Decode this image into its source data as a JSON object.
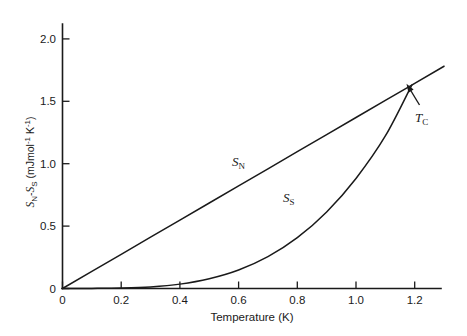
{
  "chart_data": {
    "type": "line",
    "title": "",
    "xlabel": "Temperature (K)",
    "ylabel": "S_N-S_S (mJ mol^-1 K^-1)",
    "xlim": [
      0,
      1.32
    ],
    "ylim": [
      0,
      2.22
    ],
    "grid": false,
    "legend": "inline-curve-labels",
    "xticks": [
      0,
      0.2,
      0.4,
      0.6,
      0.8,
      1.0,
      1.2
    ],
    "xtick_labels": [
      "0",
      "0.2",
      "0.4",
      "0.6",
      "0.8",
      "1.0",
      "1.2"
    ],
    "yticks": [
      0,
      0.5,
      1.0,
      1.5,
      2.0
    ],
    "ytick_labels": [
      "0",
      "0.5",
      "1.0",
      "1.5",
      "2.0"
    ],
    "series": [
      {
        "name": "S_N",
        "label": "S",
        "label_sub": "N",
        "description": "normal-state entropy, linear in temperature",
        "x": [
          0,
          0.1,
          0.2,
          0.3,
          0.4,
          0.5,
          0.6,
          0.7,
          0.8,
          0.9,
          1.0,
          1.1,
          1.19,
          1.2,
          1.3
        ],
        "y": [
          0,
          0.137,
          0.274,
          0.411,
          0.548,
          0.685,
          0.822,
          0.959,
          1.096,
          1.233,
          1.37,
          1.507,
          1.63,
          1.644,
          1.781
        ]
      },
      {
        "name": "S_S",
        "label": "S",
        "label_sub": "S",
        "description": "superconducting-state entropy, exponential/cubic rise meeting S_N at Tc",
        "x": [
          0,
          0.1,
          0.2,
          0.3,
          0.4,
          0.5,
          0.6,
          0.7,
          0.8,
          0.9,
          1.0,
          1.1,
          1.19
        ],
        "y": [
          0,
          0.001,
          0.004,
          0.013,
          0.035,
          0.078,
          0.148,
          0.255,
          0.407,
          0.613,
          0.882,
          1.222,
          1.63
        ]
      }
    ],
    "annotations": [
      {
        "name": "critical-temperature",
        "label": "T",
        "label_sub": "C",
        "x": 1.19,
        "y": 1.63,
        "kind": "arrow-to-intersection"
      }
    ],
    "colors": {
      "curve": "#1a1a1a",
      "axis": "#1a1a1a",
      "background": "#ffffff"
    }
  },
  "axes": {
    "y_label_parts": {
      "s1": "S",
      "s1_sub": "N",
      "dash": "-",
      "s2": "S",
      "s2_sub": "S",
      "unit_open": " (mJmol",
      "unit_sup1": "-1",
      "unit_mid": " K",
      "unit_sup2": "-1",
      "unit_close": ")"
    },
    "x_label": "Temperature (K)"
  }
}
